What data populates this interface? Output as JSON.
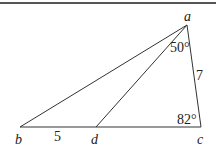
{
  "diagram": {
    "type": "triangle-geometry",
    "top_rule": {
      "y": 3,
      "color": "#555555"
    },
    "vertices": {
      "a": {
        "x": 187,
        "y": 25,
        "label": "a"
      },
      "b": {
        "x": 20,
        "y": 127,
        "label": "b"
      },
      "c": {
        "x": 201,
        "y": 127,
        "label": "c"
      },
      "d": {
        "x": 96,
        "y": 127,
        "label": "d"
      }
    },
    "segments": [
      {
        "from": "a",
        "to": "b"
      },
      {
        "from": "a",
        "to": "d"
      },
      {
        "from": "a",
        "to": "c"
      },
      {
        "from": "b",
        "to": "c"
      }
    ],
    "labels": {
      "bd_length": "5",
      "ac_length": "7",
      "angle_dac": "50°",
      "angle_c": "82°"
    },
    "line_color": "#333333"
  }
}
